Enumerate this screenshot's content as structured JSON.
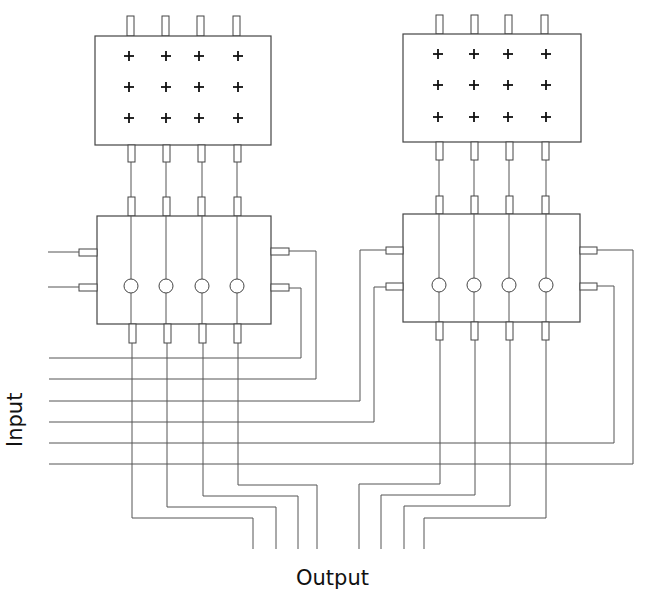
{
  "labels": {
    "input": "Input",
    "output": "Output"
  },
  "colors": {
    "line": "#555555",
    "text": "#111111",
    "background": "#ffffff"
  },
  "modules": [
    {
      "name": "left-module",
      "array_box": {
        "x": 95,
        "y": 36,
        "w": 176,
        "h": 109,
        "rows": 3,
        "cols": 4
      },
      "switch_box": {
        "x": 97,
        "y": 216,
        "w": 174,
        "h": 108
      },
      "columns": [
        131,
        166,
        202,
        237
      ],
      "cross_rows": [
        56,
        87,
        118
      ],
      "node_y": 286
    },
    {
      "name": "right-module",
      "array_box": {
        "x": 403,
        "y": 34,
        "w": 178,
        "h": 108,
        "rows": 3,
        "cols": 4
      },
      "switch_box": {
        "x": 403,
        "y": 214,
        "w": 177,
        "h": 108
      },
      "columns": [
        439,
        474,
        509,
        546
      ],
      "cross_rows": [
        55,
        86,
        117
      ],
      "node_y": 285
    }
  ],
  "input_lines_y": [
    359,
    380,
    401,
    422,
    443,
    465
  ],
  "output_count": 8
}
